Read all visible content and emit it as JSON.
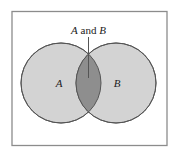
{
  "diagram": {
    "type": "venn",
    "sets": [
      {
        "id": "A",
        "label": "A"
      },
      {
        "id": "B",
        "label": "B"
      }
    ],
    "intersection": {
      "label_set1": "A",
      "label_connector": " and ",
      "label_set2": "B"
    },
    "colors": {
      "background": "#ffffff",
      "frame": "#8c8c8c",
      "circle_fill": "#d3d3d3",
      "circle_stroke": "#555555",
      "overlap_fill": "#8e8e8e",
      "pointer": "#555555"
    }
  }
}
